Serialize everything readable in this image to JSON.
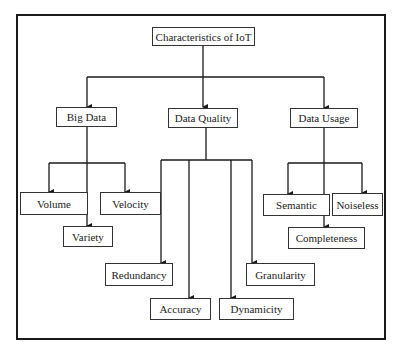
{
  "diagram": {
    "root": {
      "label": "Characteristics of IoT"
    },
    "categories": [
      {
        "label": "Big Data",
        "children": [
          "Volume",
          "Velocity",
          "Variety"
        ]
      },
      {
        "label": "Data Quality",
        "children": [
          "Redundancy",
          "Accuracy",
          "Dynamicity",
          "Granularity"
        ]
      },
      {
        "label": "Data Usage",
        "children": [
          "Semantic",
          "Noiseless",
          "Completeness"
        ]
      }
    ],
    "nodes": {
      "root": "Characteristics of IoT",
      "big_data": "Big Data",
      "data_quality": "Data Quality",
      "data_usage": "Data Usage",
      "volume": "Volume",
      "velocity": "Velocity",
      "variety": "Variety",
      "redundancy": "Redundancy",
      "accuracy": "Accuracy",
      "dynamicity": "Dynamicity",
      "granularity": "Granularity",
      "semantic": "Semantic",
      "noiseless": "Noiseless",
      "completeness": "Completeness"
    },
    "colors": {
      "line": "#1a1a1a",
      "box_border": "#333333",
      "background": "#ffffff"
    }
  }
}
